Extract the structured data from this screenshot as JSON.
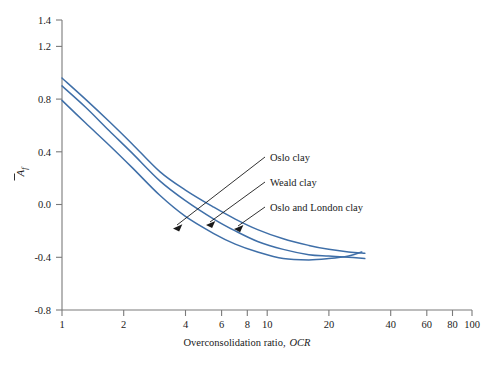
{
  "chart_data": {
    "type": "line",
    "title": "",
    "xlabel": "Overconsolidation ratio, OCR",
    "xlabel_plain": "Overconsolidation ratio,",
    "xlabel_italic": "OCR",
    "ylabel": "Āf",
    "ylabel_symbol": "A",
    "ylabel_subscript": "f",
    "xscale": "log",
    "xlim": [
      1,
      100
    ],
    "ylim": [
      -0.8,
      1.4
    ],
    "xticks": [
      1,
      2,
      4,
      6,
      8,
      10,
      20,
      40,
      60,
      80,
      100
    ],
    "xticklabels": [
      "1",
      "2",
      "4",
      "6",
      "8",
      "10",
      "20",
      "40",
      "60",
      "80",
      "100"
    ],
    "yticks": [
      -0.8,
      -0.4,
      0.0,
      0.4,
      0.8,
      1.2,
      1.4
    ],
    "yticklabels": [
      "-0.8",
      "-0.4",
      "0.0",
      "0.4",
      "0.8",
      "1.2",
      "1.4"
    ],
    "grid": false,
    "legend_position": "none",
    "line_color": "#3f6fa8",
    "axis_color": "#7a7a7a",
    "series": [
      {
        "name": "Oslo clay",
        "x": [
          1.0,
          1.3,
          1.7,
          2.2,
          3.0,
          4.0,
          5.5,
          7.0,
          9.0,
          12.0,
          16.0,
          20.0,
          25.0,
          30.0
        ],
        "values": [
          0.96,
          0.8,
          0.63,
          0.46,
          0.25,
          0.11,
          -0.02,
          -0.11,
          -0.19,
          -0.26,
          -0.31,
          -0.34,
          -0.36,
          -0.37
        ]
      },
      {
        "name": "Weald clay",
        "x": [
          1.0,
          1.3,
          1.7,
          2.2,
          3.0,
          4.0,
          5.5,
          7.0,
          9.0,
          12.0,
          16.0,
          20.0,
          25.0,
          30.0
        ],
        "values": [
          0.9,
          0.74,
          0.56,
          0.39,
          0.18,
          0.03,
          -0.11,
          -0.2,
          -0.28,
          -0.34,
          -0.38,
          -0.39,
          -0.4,
          -0.41
        ]
      },
      {
        "name": "Oslo and London clay",
        "x": [
          1.0,
          1.3,
          1.7,
          2.2,
          3.0,
          4.0,
          5.5,
          7.0,
          9.0,
          12.0,
          16.0,
          20.0,
          25.0,
          29.0
        ],
        "values": [
          0.79,
          0.62,
          0.45,
          0.28,
          0.07,
          -0.09,
          -0.22,
          -0.3,
          -0.36,
          -0.41,
          -0.42,
          -0.41,
          -0.39,
          -0.36
        ]
      }
    ],
    "annotations": [
      {
        "label": "Oslo clay",
        "target_x": 3.0,
        "target_y": -0.29
      },
      {
        "label": "Weald clay",
        "target_x": 4.3,
        "target_y": -0.18
      },
      {
        "label": "Oslo and London clay",
        "target_x": 6.2,
        "target_y": -0.1
      }
    ]
  },
  "caption": {
    "text": ""
  }
}
